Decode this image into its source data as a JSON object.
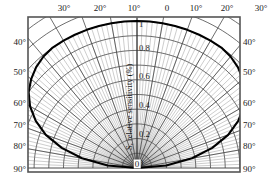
{
  "figure": {
    "kind": "polar-sensitivity-diagram",
    "radial_axis_title": "S, relative sensitivity (%)",
    "origin_label": "0",
    "colors": {
      "frame": "#555555",
      "grid": "#4d4d4d",
      "curve": "#000000",
      "text": "#1a1a1a",
      "background": "#ffffff"
    }
  },
  "chart_data": {
    "type": "line",
    "title": "S, relative sensitivity (%)",
    "xlabel": "",
    "ylabel": "S, relative sensitivity (%)",
    "coordinate_system": "polar",
    "grid": true,
    "legend": "none",
    "angle_unit": "degree",
    "angle_range": [
      -90,
      90
    ],
    "radial_range": [
      0,
      1
    ],
    "radial_ticks": [
      0,
      0.2,
      0.4,
      0.6,
      0.8,
      1
    ],
    "radial_tick_labels": [
      "0",
      "0.2",
      "0.4",
      "0.6",
      "0.8",
      "1"
    ],
    "top_axis_ticks": [
      -30,
      -20,
      -10,
      0,
      10,
      20,
      30
    ],
    "top_axis_tick_labels": [
      "30°",
      "20°",
      "10°",
      "0",
      "10°",
      "20°",
      "30°"
    ],
    "side_axis_ticks": [
      40,
      50,
      60,
      70,
      80,
      90
    ],
    "left_axis_tick_labels": [
      "40°",
      "50°",
      "60°",
      "70°",
      "80°",
      "90°"
    ],
    "right_axis_tick_labels": [
      "40°",
      "50°",
      "60°",
      "70°",
      "80°",
      "90°"
    ],
    "grid_angle_step": 10,
    "grid_radial_step": 0.1,
    "fine_ray_step": 2,
    "series": [
      {
        "name": "relative sensitivity",
        "angles_deg": [
          -90,
          -85,
          -80,
          -75,
          -70,
          -65,
          -60,
          -55,
          -50,
          -45,
          -40,
          -35,
          -30,
          -25,
          -20,
          -15,
          -10,
          -5,
          0,
          5,
          10,
          15,
          20,
          25,
          30,
          35,
          40,
          45,
          50,
          55,
          60,
          65,
          70,
          75,
          80,
          85,
          90
        ],
        "values": [
          0.0,
          0.2,
          0.38,
          0.53,
          0.66,
          0.76,
          0.84,
          0.9,
          0.94,
          0.97,
          0.99,
          1.0,
          1.0,
          1.0,
          1.0,
          1.0,
          1.0,
          1.0,
          1.0,
          1.0,
          1.0,
          1.0,
          1.0,
          1.0,
          1.0,
          1.0,
          0.99,
          0.97,
          0.94,
          0.9,
          0.84,
          0.76,
          0.66,
          0.53,
          0.38,
          0.2,
          0.0
        ]
      }
    ]
  },
  "top_labels": [
    {
      "text": "30°",
      "x": 64
    },
    {
      "text": "20°",
      "x": 100
    },
    {
      "text": "10°",
      "x": 134
    },
    {
      "text": "0",
      "x": 167
    },
    {
      "text": "10°",
      "x": 196
    },
    {
      "text": "20°",
      "x": 227
    },
    {
      "text": "30°",
      "x": 261
    }
  ],
  "left_labels": [
    {
      "text": "40°",
      "y": 42
    },
    {
      "text": "50°",
      "y": 72
    },
    {
      "text": "60°",
      "y": 103
    },
    {
      "text": "70°",
      "y": 125
    },
    {
      "text": "80°",
      "y": 146
    },
    {
      "text": "90°",
      "y": 169
    }
  ],
  "right_labels": [
    {
      "text": "40°",
      "y": 42
    },
    {
      "text": "50°",
      "y": 72
    },
    {
      "text": "60°",
      "y": 103
    },
    {
      "text": "70°",
      "y": 125
    },
    {
      "text": "80°",
      "y": 146
    },
    {
      "text": "90°",
      "y": 169
    }
  ],
  "radial_labels": [
    {
      "text": "1",
      "y": 24
    },
    {
      "text": "0.8",
      "y": 48
    },
    {
      "text": "0.6",
      "y": 76
    },
    {
      "text": "0.4",
      "y": 105
    },
    {
      "text": "0.2",
      "y": 134
    },
    {
      "text": "0",
      "y": 163
    }
  ]
}
